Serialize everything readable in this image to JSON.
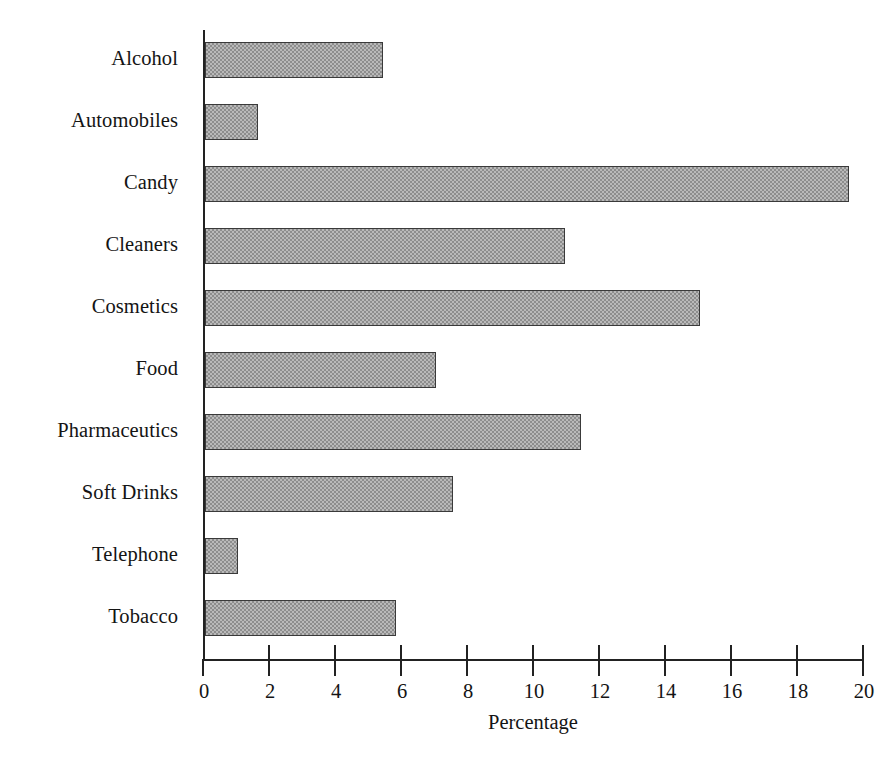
{
  "chart_data": {
    "type": "bar",
    "orientation": "horizontal",
    "title": "",
    "xlabel": "Percentage",
    "ylabel": "",
    "categories": [
      "Alcohol",
      "Automobiles",
      "Candy",
      "Cleaners",
      "Cosmetics",
      "Food",
      "Pharmaceutics",
      "Soft Drinks",
      "Telephone",
      "Tobacco"
    ],
    "values": [
      5.4,
      1.6,
      19.5,
      10.9,
      15.0,
      7.0,
      11.4,
      7.5,
      1.0,
      5.8
    ],
    "xlim": [
      0,
      20
    ],
    "xticks": [
      0,
      2,
      4,
      6,
      8,
      10,
      12,
      14,
      16,
      18,
      20
    ],
    "xtick_labels": [
      "0",
      "2",
      "4",
      "6",
      "8",
      "10",
      "12",
      "14",
      "16",
      "18",
      "20"
    ],
    "grid": false,
    "legend": false,
    "bar_fill_color": "#b9b9b9",
    "bar_pattern": "checkerboard-dither",
    "bar_edge_color": "#3a3a3a",
    "axis_color": "#222222",
    "background_color": "#ffffff"
  }
}
